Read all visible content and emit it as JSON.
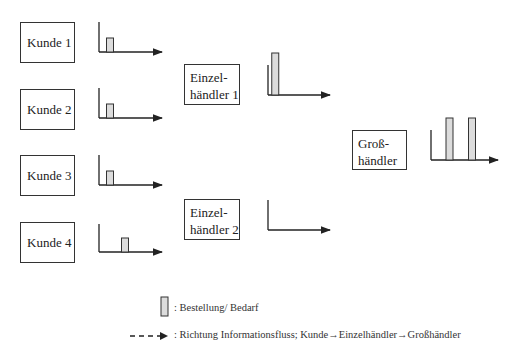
{
  "colors": {
    "line": "#222222",
    "bar_fill": "#dcdcdc",
    "bar_stroke": "#333333"
  },
  "nodes": {
    "kunde1": {
      "label": "Kunde 1"
    },
    "kunde2": {
      "label": "Kunde 2"
    },
    "kunde3": {
      "label": "Kunde 3"
    },
    "kunde4": {
      "label": "Kunde 4"
    },
    "einzelhaendler1": {
      "line1": "Einzel-",
      "line2": "händler 1"
    },
    "einzelhaendler2": {
      "line1": "Einzel-",
      "line2": "händler 2"
    },
    "grosshaendler": {
      "line1": "Groß-",
      "line2": "händler"
    }
  },
  "chart_data": [
    {
      "type": "bar",
      "title": "Kunde 1",
      "bars": [
        {
          "period": 1,
          "order": 1
        }
      ]
    },
    {
      "type": "bar",
      "title": "Kunde 2",
      "bars": [
        {
          "period": 1,
          "order": 1
        }
      ]
    },
    {
      "type": "bar",
      "title": "Kunde 3",
      "bars": [
        {
          "period": 1,
          "order": 1
        }
      ]
    },
    {
      "type": "bar",
      "title": "Kunde 4",
      "bars": [
        {
          "period": 3,
          "order": 1
        }
      ]
    },
    {
      "type": "bar",
      "title": "Einzelhändler 1",
      "bars": [
        {
          "period": 0.5,
          "order": 3
        }
      ]
    },
    {
      "type": "bar",
      "title": "Einzelhändler 2",
      "bars": []
    },
    {
      "type": "bar",
      "title": "Großhändler",
      "bars": [
        {
          "period": 2,
          "order": 3
        },
        {
          "period": 5,
          "order": 3
        }
      ]
    }
  ],
  "legend": {
    "bar_label": ": Bestellung/ Bedarf",
    "arrow_label": ": Richtung Informationsfluss; Kunde→Einzelhändler→Großhändler"
  }
}
